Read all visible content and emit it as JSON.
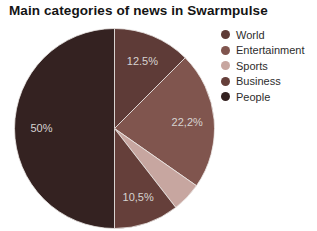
{
  "title": "Main categories of news in Swarmpulse",
  "chart_data": {
    "type": "pie",
    "title": "Main categories of news in Swarmpulse",
    "unit": "%",
    "start_angle_deg": 0,
    "direction": "clockwise",
    "legend_position": "right",
    "label_radius_ratio": 0.73,
    "label_color": "#d6d3d1",
    "separator_color": "#ece9e6",
    "slices": [
      {
        "name": "World",
        "value": 12.5,
        "label": "12.5%",
        "color": "#5e3b37"
      },
      {
        "name": "Entertainment",
        "value": 22.2,
        "label": "22,2%",
        "color": "#80554e"
      },
      {
        "name": "Sports",
        "value": 4.8,
        "label": "",
        "color": "#c7a6a0"
      },
      {
        "name": "Business",
        "value": 10.5,
        "label": "10,5%",
        "color": "#653f3a"
      },
      {
        "name": "People",
        "value": 50,
        "label": "50%",
        "color": "#342221"
      }
    ]
  }
}
